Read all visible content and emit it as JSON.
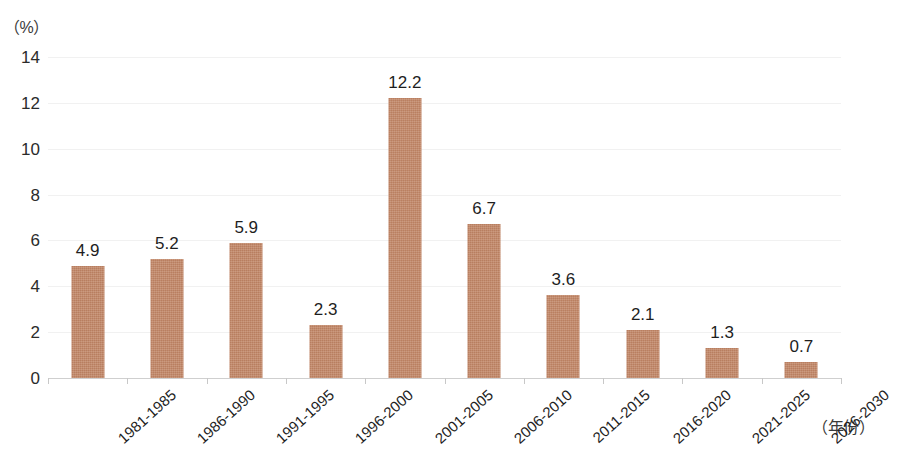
{
  "chart_data": {
    "type": "bar",
    "title": "",
    "subtitle": "",
    "xlabel": "（年份）",
    "ylabel": "（%）",
    "categories": [
      "1981-1985",
      "1986-1990",
      "1991-1995",
      "1996-2000",
      "2001-2005",
      "2006-2010",
      "2011-2015",
      "2016-2020",
      "2021-2025",
      "2026-2030"
    ],
    "values": [
      4.9,
      5.2,
      5.9,
      2.3,
      12.2,
      6.7,
      3.6,
      2.1,
      1.3,
      0.7
    ],
    "data_labels": [
      "4.9",
      "5.2",
      "5.9",
      "2.3",
      "12.2",
      "6.7",
      "3.6",
      "2.1",
      "1.3",
      "0.7"
    ],
    "ylim": [
      0,
      14
    ],
    "ytick_values": [
      0,
      2,
      4,
      6,
      8,
      10,
      12,
      14
    ],
    "ytick_labels": [
      "0",
      "2",
      "4",
      "6",
      "8",
      "10",
      "12",
      "14"
    ],
    "grid": true,
    "grid_axis": "y",
    "legend": false,
    "legend_position": "none",
    "bar_color": "#c08464",
    "gridline_color": "#f1f1f1",
    "axis_color": "#cfcfcf",
    "text_color": "#1e1e1e",
    "background_color": "#ffffff",
    "xtick_label_rotation": -42
  }
}
